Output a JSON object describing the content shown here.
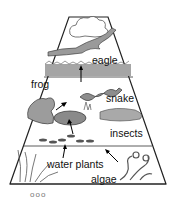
{
  "diagram": {
    "type": "energy-pyramid",
    "labels": {
      "eagle": "eagle",
      "frog": "frog",
      "snake": "snake",
      "insects": "insects",
      "water_plants": "water plants",
      "algae": "algae"
    },
    "footer": "ooo",
    "colors": {
      "outline": "#222222",
      "shading": "#8a8a8a",
      "light": "#cfcfcf"
    }
  }
}
